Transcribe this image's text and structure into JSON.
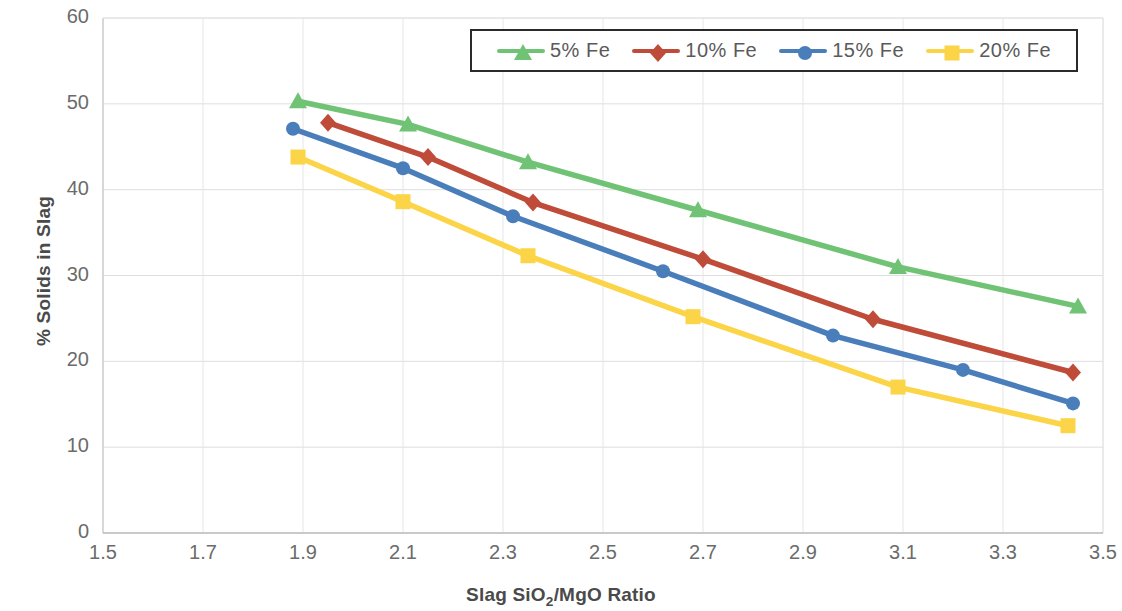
{
  "chart_data": {
    "type": "line",
    "title": "",
    "xlabel": "Slag SiO2/MgO Ratio",
    "ylabel": "% Solids in Slag",
    "xlim": [
      1.5,
      3.5
    ],
    "ylim": [
      0,
      60
    ],
    "xticks": [
      "1.5",
      "1.7",
      "1.9",
      "2.1",
      "2.3",
      "2.5",
      "2.7",
      "2.9",
      "3.1",
      "3.3",
      "3.5"
    ],
    "yticks": [
      "0",
      "10",
      "20",
      "30",
      "40",
      "50",
      "60"
    ],
    "grid": true,
    "legend_position": "top-center",
    "series": [
      {
        "name": "5% Fe",
        "color": "#70C375",
        "marker": "triangle",
        "x": [
          1.89,
          2.11,
          2.35,
          2.69,
          3.09,
          3.45
        ],
        "y": [
          50.3,
          47.6,
          43.2,
          37.6,
          31.0,
          26.4
        ]
      },
      {
        "name": "10% Fe",
        "color": "#BF4B39",
        "marker": "diamond",
        "x": [
          1.95,
          2.15,
          2.36,
          2.7,
          3.04,
          3.44
        ],
        "y": [
          47.8,
          43.8,
          38.5,
          31.9,
          24.9,
          18.7
        ]
      },
      {
        "name": "15% Fe",
        "color": "#4A7EBB",
        "marker": "circle",
        "x": [
          1.88,
          2.1,
          2.32,
          2.62,
          2.96,
          3.22,
          3.44
        ],
        "y": [
          47.1,
          42.5,
          36.9,
          30.5,
          23.0,
          19.0,
          15.1
        ]
      },
      {
        "name": "20% Fe",
        "color": "#FCD448",
        "marker": "square",
        "x": [
          1.89,
          2.1,
          2.35,
          2.68,
          3.09,
          3.43
        ],
        "y": [
          43.8,
          38.6,
          32.3,
          25.2,
          17.0,
          12.5
        ]
      }
    ]
  },
  "legend": {
    "entries": [
      {
        "label": "5% Fe"
      },
      {
        "label": "10% Fe"
      },
      {
        "label": "15% Fe"
      },
      {
        "label": "20% Fe"
      }
    ]
  },
  "axes": {
    "y_title": "% Solids in Slag",
    "x_title_part1": "Slag SiO",
    "x_title_sub": "2",
    "x_title_part2": "/MgO Ratio"
  }
}
